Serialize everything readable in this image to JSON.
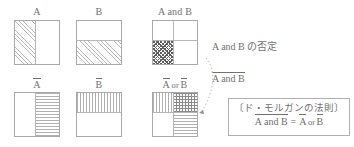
{
  "diagram": {
    "title_implicit": "De Morgan's law Venn/box diagram",
    "panels": [
      {
        "id": "A",
        "label": "A",
        "shaded": "left half",
        "pattern": "diagonal-hatch"
      },
      {
        "id": "B",
        "label": "B",
        "shaded": "bottom half",
        "pattern": "diagonal-hatch"
      },
      {
        "id": "A-and-B",
        "label": "A and B",
        "shaded": "bottom-left quadrant",
        "pattern": "checker"
      },
      {
        "id": "not-A",
        "label": "A",
        "label_overline": true,
        "shaded": "right half",
        "pattern": "horizontal-lines"
      },
      {
        "id": "not-B",
        "label": "B",
        "label_overline": true,
        "shaded": "top half",
        "pattern": "vertical-lines"
      },
      {
        "id": "notA-or-notB",
        "label_parts": [
          "A",
          "or",
          "B"
        ],
        "label_text": "A or B",
        "shaded": "top-left vertical, top-right crosshatch, bottom-right horizontal",
        "pattern": "mixed"
      }
    ],
    "annotations": {
      "negation_caption": "A and B の否定",
      "negation_term_text": "A and B",
      "negation_term_overline": true,
      "arrow": "dotted-curved-arrow"
    },
    "law_box": {
      "heading": "〔ド・モルガンの法則〕",
      "formula_left": "A and B",
      "formula_equals": "=",
      "formula_right_a": "A",
      "formula_right_or": "or",
      "formula_right_b": "B"
    }
  },
  "colors": {
    "ink": "#6f6f6f",
    "rule": "#a9a9a9",
    "hatch_light": "#b8b8b8",
    "hatch_dark": "#5d5d5d",
    "background": "#ffffff"
  }
}
